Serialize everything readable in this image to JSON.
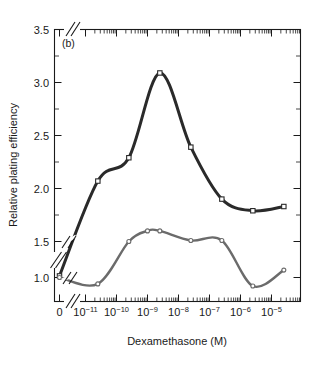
{
  "figure": {
    "panel_label": "(b)",
    "xlabel": "Dexamethasone (M)",
    "ylabel": "Relative plating efficiency"
  },
  "axes": {
    "y_ticks": [
      "1.0",
      "1.5",
      "2.0",
      "2.5",
      "3.0",
      "3.5"
    ],
    "x_tick_zero": "0",
    "x_tick_mantissa": "10",
    "x_exponents": [
      "−11",
      "−10",
      "−9",
      "−8",
      "−7",
      "−6",
      "−5"
    ],
    "y_break_between": [
      "1.0",
      "1.5"
    ],
    "x_break_after": "0"
  },
  "colors": {
    "dark_series": "#2a2a2a",
    "gray_series": "#6b6b6b",
    "axis": "#1a1a1a",
    "marker_fill": "#ffffff",
    "background": "#ffffff"
  },
  "chart_data": {
    "type": "line",
    "title": "(b)",
    "xlabel": "Dexamethasone (M)",
    "ylabel": "Relative plating efficiency",
    "xscale": "log",
    "x_axis_note": "Zero value plotted at far left, separated by an axis break, then logarithmic from 1e-11 to 1e-5",
    "xlim": [
      1e-11,
      3e-05
    ],
    "ylim": [
      1.0,
      3.5
    ],
    "y_axis_break": [
      1.05,
      1.45
    ],
    "yticks": [
      1.0,
      1.5,
      2.0,
      2.5,
      3.0,
      3.5
    ],
    "xticks": [
      1e-11,
      1e-10,
      1e-09,
      1e-08,
      1e-07,
      1e-06,
      1e-05
    ],
    "grid": false,
    "legend": "none",
    "series": [
      {
        "name": "upper-curve",
        "marker": "square",
        "color": "#2a2a2a",
        "x": [
          0,
          2.5e-11,
          2.5e-10,
          2.5e-09,
          2.5e-08,
          2.5e-07,
          2.5e-06,
          2.5e-05
        ],
        "x_labels": [
          "0",
          "2.5e-11",
          "2.5e-10",
          "2.5e-9",
          "2.5e-8",
          "2.5e-7",
          "2.5e-6",
          "2.5e-5"
        ],
        "values": [
          1.02,
          2.07,
          2.29,
          3.09,
          2.39,
          1.9,
          1.79,
          1.83
        ]
      },
      {
        "name": "lower-curve",
        "marker": "circle",
        "color": "#6b6b6b",
        "x": [
          0,
          2.5e-11,
          2.5e-10,
          1e-09,
          2.5e-09,
          2.5e-08,
          2.5e-07,
          2.5e-06,
          2.5e-05
        ],
        "x_labels": [
          "0",
          "2.5e-11",
          "2.5e-10",
          "1.0e-9",
          "2.5e-9",
          "2.5e-8",
          "2.5e-7",
          "2.5e-6",
          "2.5e-5"
        ],
        "values": [
          1.0,
          1.1,
          1.5,
          1.6,
          1.6,
          1.51,
          1.51,
          1.08,
          1.23
        ]
      }
    ]
  }
}
